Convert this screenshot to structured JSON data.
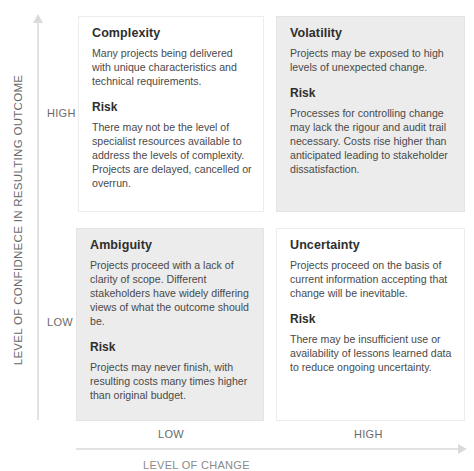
{
  "axes": {
    "y_label": "LEVEL OF CONFIDNECE IN RESULTING OUTCOME",
    "y_ticks": {
      "high": "HIGH",
      "low": "LOW"
    },
    "x_label": "LEVEL OF CHANGE",
    "x_ticks": {
      "low": "LOW",
      "high": "HIGH"
    }
  },
  "quadrants": {
    "top_left": {
      "title": "Complexity",
      "description": "Many projects being delivered with unique characteristics and technical requirements.",
      "risk_label": "Risk",
      "risk_text": "There may not be the level of specialist resources available to address the levels of complexity. Projects are delayed, cancelled or overrun.",
      "shade": "#ffffff"
    },
    "top_right": {
      "title": "Volatility",
      "description": "Projects may be exposed to high levels of unexpected change.",
      "risk_label": "Risk",
      "risk_text": "Processes for controlling change may lack the rigour and audit trail necessary. Costs rise higher than anticipated leading to  stakeholder dissatisfaction.",
      "shade": "#ececec"
    },
    "bottom_left": {
      "title": "Ambiguity",
      "description": "Projects proceed with a lack of clarity of scope.  Different stakeholders have widely differing views of what the outcome should be.",
      "risk_label": "Risk",
      "risk_text": "Projects may never finish, with resulting costs many times higher than original budget.",
      "shade": "#ececec"
    },
    "bottom_right": {
      "title": "Uncertainty",
      "description": "Projects proceed on the basis of current information accepting that change will be inevitable.",
      "risk_label": "Risk",
      "risk_text": "There may be insufficient use or availability of lessons learned data to reduce ongoing uncertainty.",
      "shade": "#ffffff"
    }
  }
}
